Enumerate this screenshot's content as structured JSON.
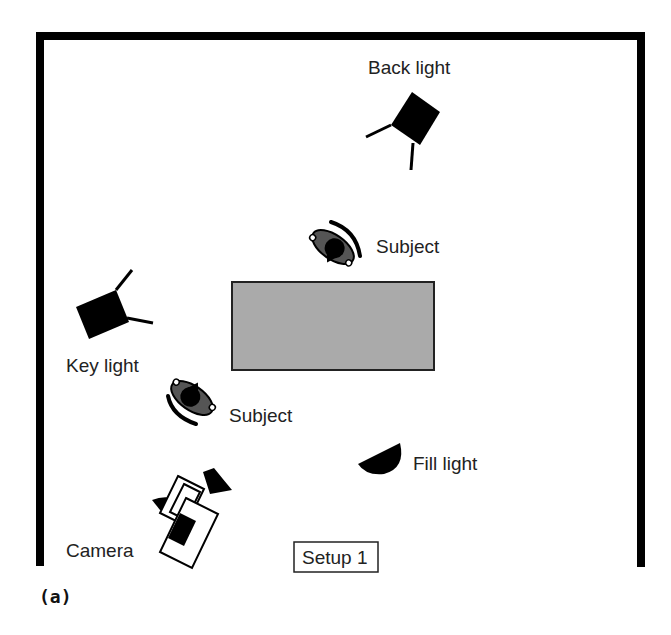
{
  "diagram": {
    "caption": "(a)",
    "setup_label": "Setup 1",
    "colors": {
      "wall": "#000000",
      "table_fill": "#aaaaaa",
      "table_border": "#222222",
      "subject_dark": "#000000",
      "subject_shade": "#555555",
      "text": "#222222"
    },
    "elements": [
      {
        "id": "back-light",
        "label": "Back light",
        "icon": "spotlight-icon"
      },
      {
        "id": "subject-top",
        "label": "Subject",
        "icon": "person-topdown-icon"
      },
      {
        "id": "key-light",
        "label": "Key light",
        "icon": "spotlight-icon"
      },
      {
        "id": "table",
        "label": "",
        "icon": "table-rect"
      },
      {
        "id": "subject-bottom",
        "label": "Subject",
        "icon": "person-topdown-icon"
      },
      {
        "id": "fill-light",
        "label": "Fill light",
        "icon": "fill-light-icon"
      },
      {
        "id": "camera",
        "label": "Camera",
        "icon": "camera-icon"
      }
    ]
  }
}
